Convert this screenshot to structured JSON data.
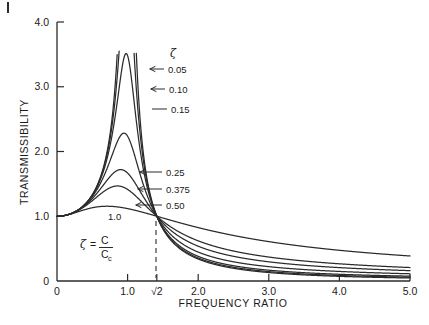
{
  "figure": {
    "background_color": "#ffffff",
    "line_color": "#2b2b2b"
  },
  "axes": {
    "x_title": "FREQUENCY RATIO",
    "y_title": "TRANSMISSIBILITY",
    "x_ticks": [
      "0",
      "1.0",
      "√2",
      "2.0",
      "3.0",
      "4.0",
      "5.0"
    ],
    "x_tick_values": [
      0,
      1.0,
      1.414,
      2.0,
      3.0,
      4.0,
      5.0
    ],
    "y_ticks": [
      "0",
      "1.0",
      "2.0",
      "3.0",
      "4.0"
    ],
    "y_tick_values": [
      0,
      1.0,
      2.0,
      3.0,
      4.0
    ],
    "x_origin_label": "0",
    "y_origin_label": "0"
  },
  "annotations": {
    "zeta_symbol": "ζ",
    "formula_zeta": "ζ",
    "formula_equals": "=",
    "formula_numerator": "C",
    "formula_denominator": "C",
    "formula_denominator_sub": "c",
    "curve_labels": [
      {
        "text": "0.05",
        "value": 0.05
      },
      {
        "text": "0.10",
        "value": 0.1
      },
      {
        "text": "0.15",
        "value": 0.15
      },
      {
        "text": "0.25",
        "value": 0.25
      },
      {
        "text": "0.375",
        "value": 0.375
      },
      {
        "text": "0.50",
        "value": 0.5
      },
      {
        "text": "1.0",
        "value": 1.0
      }
    ],
    "crossover_label": "√2"
  },
  "chart_data": {
    "type": "line",
    "title": "",
    "xlabel": "FREQUENCY RATIO",
    "ylabel": "TRANSMISSIBILITY",
    "xlim": [
      0,
      5.0
    ],
    "ylim": [
      0,
      4.0
    ],
    "grid": false,
    "legend_position": "inline-labels",
    "formula": "T = sqrt(1 + (2*zeta*r)^2) / sqrt((1 - r^2)^2 + (2*zeta*r)^2)",
    "clip_top": 3.55,
    "crossover_point": {
      "x": 1.414,
      "y": 1.0
    },
    "series": [
      {
        "name": "0.05",
        "zeta": 0.05,
        "peak": {
          "x": 1.0,
          "y": 3.55
        },
        "points_x": [
          0,
          0.25,
          0.5,
          0.75,
          0.9,
          1.0,
          1.1,
          1.2,
          1.414,
          1.75,
          2.0,
          2.5,
          3.0,
          3.5,
          4.0,
          4.5,
          5.0
        ],
        "points_y": [
          1.0,
          1.07,
          1.34,
          2.28,
          3.55,
          3.55,
          3.55,
          2.35,
          1.0,
          0.49,
          0.34,
          0.19,
          0.13,
          0.09,
          0.07,
          0.05,
          0.04
        ]
      },
      {
        "name": "0.10",
        "zeta": 0.1,
        "peak": {
          "x": 1.0,
          "y": 3.55
        },
        "points_x": [
          0,
          0.25,
          0.5,
          0.75,
          0.9,
          1.0,
          1.1,
          1.2,
          1.414,
          1.75,
          2.0,
          2.5,
          3.0,
          3.5,
          4.0,
          4.5,
          5.0
        ],
        "points_y": [
          1.0,
          1.07,
          1.34,
          2.25,
          3.55,
          3.55,
          3.55,
          2.32,
          1.0,
          0.5,
          0.35,
          0.21,
          0.14,
          0.11,
          0.08,
          0.07,
          0.06
        ]
      },
      {
        "name": "0.15",
        "zeta": 0.15,
        "peak": {
          "x": 1.0,
          "y": 3.55
        },
        "points_x": [
          0,
          0.25,
          0.5,
          0.75,
          0.9,
          1.0,
          1.1,
          1.2,
          1.414,
          1.75,
          2.0,
          2.5,
          3.0,
          3.5,
          4.0,
          4.5,
          5.0
        ],
        "points_y": [
          1.0,
          1.07,
          1.35,
          2.2,
          3.41,
          3.55,
          3.38,
          2.28,
          1.0,
          0.52,
          0.37,
          0.23,
          0.17,
          0.13,
          0.11,
          0.09,
          0.08
        ]
      },
      {
        "name": "0.25",
        "zeta": 0.25,
        "peak": {
          "x": 0.98,
          "y": 2.2
        },
        "points_x": [
          0,
          0.25,
          0.5,
          0.75,
          0.9,
          1.0,
          1.1,
          1.2,
          1.414,
          1.75,
          2.0,
          2.5,
          3.0,
          3.5,
          4.0,
          4.5,
          5.0
        ],
        "points_y": [
          1.0,
          1.07,
          1.35,
          1.91,
          2.16,
          2.2,
          2.04,
          1.7,
          1.0,
          0.58,
          0.43,
          0.29,
          0.22,
          0.18,
          0.15,
          0.13,
          0.12
        ]
      },
      {
        "name": "0.375",
        "zeta": 0.375,
        "peak": {
          "x": 0.95,
          "y": 1.7
        },
        "points_x": [
          0,
          0.25,
          0.5,
          0.75,
          0.9,
          1.0,
          1.1,
          1.2,
          1.414,
          1.75,
          2.0,
          2.5,
          3.0,
          3.5,
          4.0,
          4.5,
          5.0
        ],
        "points_y": [
          1.0,
          1.06,
          1.32,
          1.6,
          1.69,
          1.7,
          1.62,
          1.46,
          1.0,
          0.67,
          0.54,
          0.38,
          0.3,
          0.25,
          0.22,
          0.2,
          0.18
        ]
      },
      {
        "name": "0.50",
        "zeta": 0.5,
        "peak": {
          "x": 0.92,
          "y": 1.44
        },
        "points_x": [
          0,
          0.25,
          0.5,
          0.75,
          0.9,
          1.0,
          1.1,
          1.2,
          1.414,
          1.75,
          2.0,
          2.5,
          3.0,
          3.5,
          4.0,
          4.5,
          5.0
        ],
        "points_y": [
          1.0,
          1.06,
          1.26,
          1.4,
          1.44,
          1.41,
          1.37,
          1.29,
          1.0,
          0.75,
          0.62,
          0.46,
          0.37,
          0.32,
          0.28,
          0.25,
          0.23
        ]
      },
      {
        "name": "1.0",
        "zeta": 1.0,
        "peak": {
          "x": 0.78,
          "y": 1.25
        },
        "points_x": [
          0,
          0.25,
          0.5,
          0.75,
          0.9,
          1.0,
          1.1,
          1.2,
          1.414,
          1.75,
          2.0,
          2.5,
          3.0,
          3.5,
          4.0,
          4.5,
          5.0
        ],
        "points_y": [
          1.0,
          1.06,
          1.18,
          1.25,
          1.24,
          1.22,
          1.19,
          1.15,
          1.0,
          0.87,
          0.79,
          0.66,
          0.57,
          0.5,
          0.45,
          0.41,
          0.38
        ]
      }
    ]
  }
}
